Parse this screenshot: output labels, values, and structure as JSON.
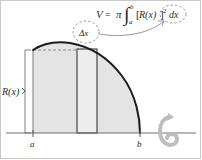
{
  "figure": {
    "formula": {
      "v": "V",
      "equals": "=",
      "pi": "π",
      "integral_sign": "∫",
      "upper_limit": "b",
      "lower_limit": "a",
      "integrand_open": "[",
      "integrand_fn": "R(x)",
      "integrand_close": "]",
      "exponent": "2",
      "differential": "dx",
      "full_text": "V = π ∫ₐᵇ [R(x)]² dx"
    },
    "labels": {
      "delta_x": "Δx",
      "radius": "R(x)",
      "lower_bound": "a",
      "upper_bound": "b"
    },
    "icons": {
      "rotation": "rotation-arrow-icon",
      "callout_arrow": "curved-arrow-icon",
      "highlight_circle_delta": "dashed-circle-icon",
      "highlight_circle_dx": "dashed-circle-icon"
    },
    "colors": {
      "background": "#ffffff",
      "region_fill": "#e4e4e4",
      "slice_fill": "#ededed",
      "curve_stroke": "#1c1c1c",
      "axis_stroke": "#6e6e6e",
      "dashed_stroke": "#8c8c8c",
      "text": "#2b2b2b",
      "rotation_icon": "#bdbdbd",
      "border": "#c9c9c9"
    },
    "geometry": {
      "axis_y": 133,
      "axis_x_start": 6,
      "axis_x_end": 196,
      "a_x": 33,
      "b_x": 140,
      "slice_left_x": 77,
      "slice_right_x": 97,
      "region_top_y": 50,
      "curve_peak_y": 40
    }
  }
}
